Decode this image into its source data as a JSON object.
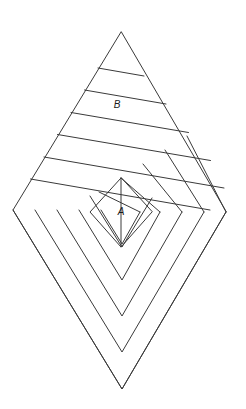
{
  "figure": {
    "background_color": "#ffffff",
    "line_color": "#3a3a3a",
    "line_width": 1,
    "canvas": {
      "width": 246,
      "height": 409
    }
  },
  "outline": {
    "name": "rhombus-outline",
    "vertices": {
      "top": {
        "x": 121,
        "y": 32
      },
      "left": {
        "x": 13,
        "y": 210
      },
      "right": {
        "x": 226,
        "y": 212
      },
      "bottom": {
        "x": 122,
        "y": 389
      }
    },
    "path": "M121,32 L13,210 L122,389 L226,212 Z"
  },
  "labels": [
    {
      "id": "label-b",
      "text": "B",
      "x": 117,
      "y": 105
    },
    {
      "id": "label-a",
      "text": "A",
      "x": 121,
      "y": 212
    }
  ],
  "upper_stripes": {
    "name": "upper-triangle-stripes",
    "count": 6,
    "description": "Parallel lines across the upper triangle, slanting parallel to the lower-left edge",
    "paths": [
      "M98.0,68.0 L144.0,76.0",
      "M84.5,90.0 L166.0,104.0",
      "M71.0,112.5 L188.5,132.5",
      "M57.5,134.5 L210.5,160.5",
      "M44.0,157.0 L224.0,188.0",
      "M30.5,179.0 L210.0,210.0"
    ]
  },
  "lower_chevrons": {
    "name": "lower-nested-chevrons",
    "count": 6,
    "description": "Nested V-shaped bands in the lower half, apexes stepping toward the bottom vertex",
    "paths": [
      "M13,210 L122,389 L226,212",
      "M35,210 L122,352 L204,212",
      "M57,210 L122,316 L182,212",
      "M79,210 L122,280 L160,212",
      "M101,210 L122,244 L140,212",
      "M90,196 L122,247 L152,198"
    ]
  },
  "center_diamond": {
    "name": "center-diamond-a",
    "path": "M121,178 L90,212 L121,247 L152,212 Z"
  },
  "fan_lines": {
    "name": "upper-right-fan-lines",
    "count": 6,
    "description": "Short parallel lines from the stripe boundary down into the right chevron bands",
    "paths": [
      "M121,178 L160,212",
      "M143,164 L182,212",
      "M165,150 L204,212",
      "M187,136 L226,212",
      "M99,192 L140,212",
      "M121,178 L121,247"
    ]
  }
}
